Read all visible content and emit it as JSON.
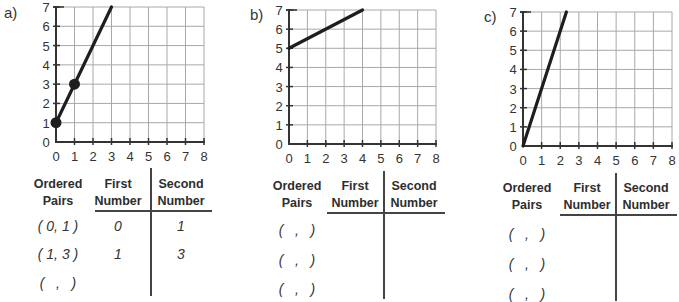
{
  "chart_data": [
    {
      "type": "line",
      "label": "a)",
      "x_ticks": [
        "0",
        "1",
        "2",
        "3",
        "4",
        "5",
        "6",
        "7",
        "8"
      ],
      "y_ticks": [
        "0",
        "1",
        "2",
        "3",
        "4",
        "5",
        "6",
        "7"
      ],
      "xlim": [
        0,
        8
      ],
      "ylim": [
        0,
        7
      ],
      "grid": true,
      "line": {
        "from": [
          0,
          1
        ],
        "to": [
          3,
          7
        ]
      },
      "points": [
        [
          0,
          1
        ],
        [
          1,
          3
        ]
      ]
    },
    {
      "type": "line",
      "label": "b)",
      "x_ticks": [
        "0",
        "1",
        "2",
        "3",
        "4",
        "5",
        "6",
        "7",
        "8"
      ],
      "y_ticks": [
        "0",
        "1",
        "2",
        "3",
        "4",
        "5",
        "6",
        "7"
      ],
      "xlim": [
        0,
        8
      ],
      "ylim": [
        0,
        7
      ],
      "grid": true,
      "line": {
        "from": [
          0,
          5
        ],
        "to": [
          4,
          7
        ]
      },
      "points": []
    },
    {
      "type": "line",
      "label": "c)",
      "x_ticks": [
        "0",
        "1",
        "2",
        "3",
        "4",
        "5",
        "6",
        "7",
        "8"
      ],
      "y_ticks": [
        "0",
        "1",
        "2",
        "3",
        "4",
        "5",
        "6",
        "7"
      ],
      "xlim": [
        0,
        8
      ],
      "ylim": [
        0,
        7
      ],
      "grid": true,
      "line": {
        "from": [
          0,
          0
        ],
        "to": [
          2.33,
          7
        ]
      },
      "points": []
    }
  ],
  "tables": [
    {
      "headers": {
        "pairs": [
          "Ordered",
          "Pairs"
        ],
        "first": [
          "First",
          "Number"
        ],
        "second": [
          "Second",
          "Number"
        ]
      },
      "rows": [
        {
          "pair": "( 0, 1 )",
          "first": "0",
          "second": "1"
        },
        {
          "pair": "( 1, 3 )",
          "first": "1",
          "second": "3"
        },
        {
          "pair": "(   ,   )",
          "first": "",
          "second": ""
        }
      ]
    },
    {
      "headers": {
        "pairs": [
          "Ordered",
          "Pairs"
        ],
        "first": [
          "First",
          "Number"
        ],
        "second": [
          "Second",
          "Number"
        ]
      },
      "rows": [
        {
          "pair": "(   ,   )",
          "first": "",
          "second": ""
        },
        {
          "pair": "(   ,   )",
          "first": "",
          "second": ""
        },
        {
          "pair": "(   ,   )",
          "first": "",
          "second": ""
        }
      ]
    },
    {
      "headers": {
        "pairs": [
          "Ordered",
          "Pairs"
        ],
        "first": [
          "First",
          "Number"
        ],
        "second": [
          "Second",
          "Number"
        ]
      },
      "rows": [
        {
          "pair": "(   ,   )",
          "first": "",
          "second": ""
        },
        {
          "pair": "(   ,   )",
          "first": "",
          "second": ""
        },
        {
          "pair": "(   ,   )",
          "first": "",
          "second": ""
        }
      ]
    }
  ],
  "colors": {
    "grid": "#a8a8a8",
    "axis": "#333333",
    "line": "#1e1e1e"
  }
}
